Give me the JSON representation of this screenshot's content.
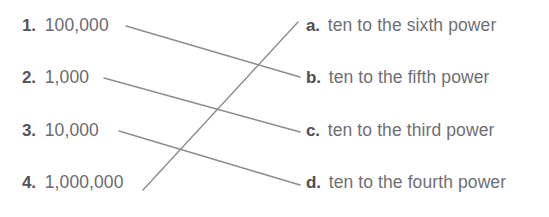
{
  "worksheet": {
    "type": "matching-exercise",
    "background_color": "#ffffff",
    "line_color": "#8d8d90",
    "marker_color": "#555558",
    "text_color": "#6a6a6e",
    "left_column": [
      {
        "marker": "1.",
        "value": "100,000"
      },
      {
        "marker": "2.",
        "value": "1,000"
      },
      {
        "marker": "3.",
        "value": "10,000"
      },
      {
        "marker": "4.",
        "value": "1,000,000"
      }
    ],
    "right_column": [
      {
        "marker": "a.",
        "answer": "ten to the sixth power"
      },
      {
        "marker": "b.",
        "answer": "ten to the fifth power"
      },
      {
        "marker": "c.",
        "answer": "ten to the third power"
      },
      {
        "marker": "d.",
        "answer": "ten to the fourth power"
      }
    ],
    "connections": [
      {
        "from": "1",
        "to": "b",
        "x1": 126,
        "y1": 26,
        "x2": 300,
        "y2": 77
      },
      {
        "from": "2",
        "to": "c",
        "x1": 104,
        "y1": 78,
        "x2": 300,
        "y2": 132
      },
      {
        "from": "3",
        "to": "d",
        "x1": 119,
        "y1": 131,
        "x2": 300,
        "y2": 185
      },
      {
        "from": "4",
        "to": "a",
        "x1": 143,
        "y1": 190,
        "x2": 298,
        "y2": 22
      }
    ]
  }
}
